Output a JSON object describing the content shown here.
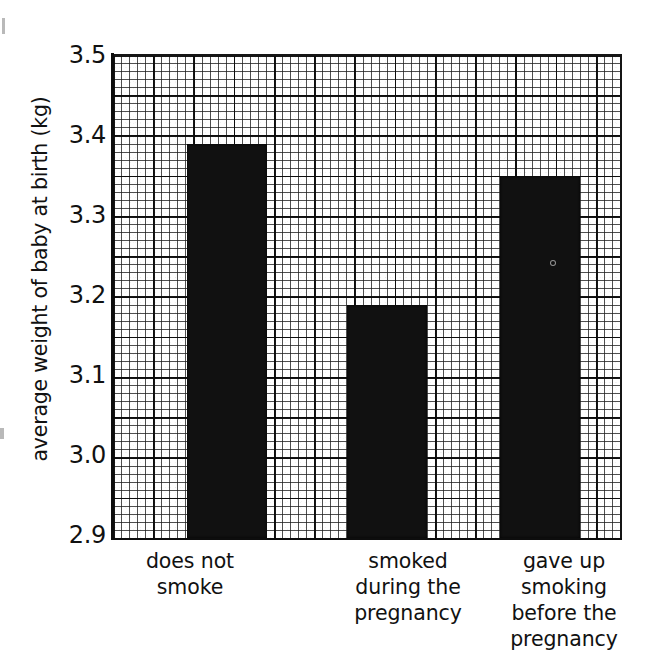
{
  "chart_data": {
    "type": "bar",
    "title": "",
    "subtitle": "",
    "xlabel": "",
    "ylabel": "average weight of baby at birth (kg)",
    "categories": [
      "does not smoke",
      "smoked during the pregnancy",
      "gave up smoking before the pregnancy"
    ],
    "category_lines": [
      [
        "does not",
        "smoke"
      ],
      [
        "smoked",
        "during the",
        "pregnancy"
      ],
      [
        "gave up",
        "smoking",
        "before the",
        "pregnancy"
      ]
    ],
    "values": [
      3.39,
      3.19,
      3.35
    ],
    "ylim": [
      2.9,
      3.5
    ],
    "ytick_labels": [
      "3.5",
      "3.4",
      "3.3",
      "3.2",
      "3.1",
      "3.0",
      "2.9"
    ],
    "ytick_values": [
      3.5,
      3.4,
      3.3,
      3.2,
      3.1,
      3.0,
      2.9
    ],
    "ytick_interval": 0.1,
    "grid": "graph-paper, minor and major squared gridlines",
    "legend": "none",
    "bar_color": "#111111",
    "background_color": "#ffffff",
    "annotations": []
  },
  "axis": {
    "y_title": "average weight of baby at birth (kg)",
    "ticks": [
      {
        "label": "3.5",
        "value": 3.5
      },
      {
        "label": "3.4",
        "value": 3.4
      },
      {
        "label": "3.3",
        "value": 3.3
      },
      {
        "label": "3.2",
        "value": 3.2
      },
      {
        "label": "3.1",
        "value": 3.1
      },
      {
        "label": "3.0",
        "value": 3.0
      },
      {
        "label": "2.9",
        "value": 2.9
      }
    ]
  },
  "x_categories": [
    {
      "lines": [
        "does not",
        "smoke"
      ]
    },
    {
      "lines": [
        "smoked",
        "during the",
        "pregnancy"
      ]
    },
    {
      "lines": [
        "gave up",
        "smoking",
        "before the",
        "pregnancy"
      ]
    }
  ],
  "bars": [
    {
      "category": "does not smoke",
      "value": 3.39
    },
    {
      "category": "smoked during the pregnancy",
      "value": 3.19
    },
    {
      "category": "gave up smoking before the pregnancy",
      "value": 3.35
    }
  ]
}
